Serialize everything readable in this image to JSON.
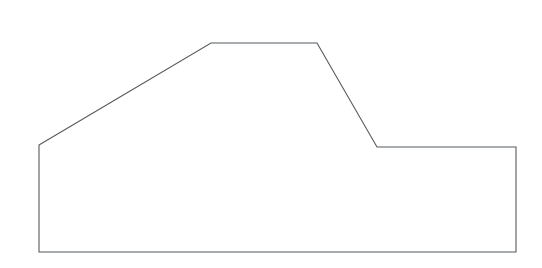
{
  "canvas": {
    "width": 542,
    "height": 268,
    "background_color": "#ffffff"
  },
  "figure": {
    "name": "polygon-outline",
    "shape_type": "polygon",
    "closed": true,
    "fill": "none",
    "stroke_color": "#555a5e",
    "stroke_width": 1.1,
    "vertex_count": 7,
    "vertices": [
      {
        "label": "left-base-top",
        "x": 39,
        "y": 145
      },
      {
        "label": "plateau-left",
        "x": 211,
        "y": 43
      },
      {
        "label": "plateau-right",
        "x": 317,
        "y": 43
      },
      {
        "label": "step-notch",
        "x": 377,
        "y": 147
      },
      {
        "label": "right-top",
        "x": 516,
        "y": 147
      },
      {
        "label": "right-base",
        "x": 516,
        "y": 252
      },
      {
        "label": "left-base",
        "x": 39,
        "y": 252
      }
    ],
    "points_attr": "39,145 211,43 317,43 377,147 516,147 516,252 39,252",
    "edges": [
      {
        "name": "left-riser",
        "orientation": "vertical",
        "from": "left-base-top",
        "to": "left-base"
      },
      {
        "name": "left-slope",
        "orientation": "diagonal-up",
        "from": "left-base-top",
        "to": "plateau-left"
      },
      {
        "name": "plateau-top",
        "orientation": "horizontal",
        "from": "plateau-left",
        "to": "plateau-right"
      },
      {
        "name": "right-slope",
        "orientation": "diagonal-down",
        "from": "plateau-right",
        "to": "step-notch"
      },
      {
        "name": "step-shelf",
        "orientation": "horizontal",
        "from": "step-notch",
        "to": "right-top"
      },
      {
        "name": "right-riser",
        "orientation": "vertical",
        "from": "right-top",
        "to": "right-base"
      },
      {
        "name": "baseline",
        "orientation": "horizontal",
        "from": "right-base",
        "to": "left-base"
      }
    ]
  }
}
